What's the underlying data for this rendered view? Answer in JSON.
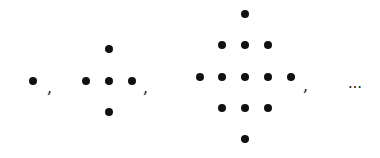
{
  "figure": {
    "separator": ",",
    "ellipsis": "…",
    "dot_color": "#111111",
    "background": "#ffffff",
    "terms": [
      {
        "n": 1,
        "dot_count": 1,
        "dots": [
          [
            33,
            81
          ]
        ]
      },
      {
        "n": 2,
        "dot_count": 5,
        "dots": [
          [
            109,
            49
          ],
          [
            86,
            81
          ],
          [
            109,
            81
          ],
          [
            132,
            81
          ],
          [
            109,
            112
          ]
        ]
      },
      {
        "n": 3,
        "dot_count": 13,
        "dots": [
          [
            245,
            14
          ],
          [
            222,
            45
          ],
          [
            245,
            45
          ],
          [
            268,
            45
          ],
          [
            200,
            77
          ],
          [
            222,
            77
          ],
          [
            245,
            77
          ],
          [
            268,
            77
          ],
          [
            291,
            77
          ],
          [
            222,
            108
          ],
          [
            245,
            108
          ],
          [
            268,
            108
          ],
          [
            245,
            139
          ]
        ]
      }
    ],
    "separators_pos": [
      [
        47,
        80
      ],
      [
        143,
        80
      ],
      [
        303,
        78
      ]
    ],
    "ellipsis_pos": [
      348,
      76
    ]
  }
}
